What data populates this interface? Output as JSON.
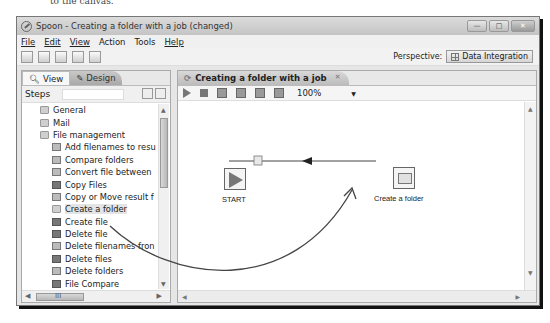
{
  "caption_fragment": "to the canvas.",
  "window": {
    "title": "Spoon - Creating a folder with a job (changed)",
    "controls": [
      "minimize",
      "maximize",
      "close"
    ]
  },
  "menu": [
    {
      "label": "File",
      "mnemonic": "F"
    },
    {
      "label": "Edit",
      "mnemonic": "E"
    },
    {
      "label": "View",
      "mnemonic": "V"
    },
    {
      "label": "Action",
      "mnemonic": ""
    },
    {
      "label": "Tools",
      "mnemonic": ""
    },
    {
      "label": "Help",
      "mnemonic": "H"
    }
  ],
  "toolbar": {
    "icons": [
      "new-file-icon",
      "open-icon",
      "explore-repository-icon",
      "save-icon",
      "save-as-icon"
    ],
    "perspective_label": "Perspective:",
    "perspective_value": "Data Integration"
  },
  "left_panel": {
    "tabs": [
      {
        "label": "View",
        "icon": "magnifier-icon"
      },
      {
        "label": "Design",
        "icon": "pencil-icon",
        "active": true
      }
    ],
    "steps_label": "Steps",
    "steps_search_value": "",
    "tree": [
      {
        "label": "General",
        "type": "category",
        "icon": "folder-icon"
      },
      {
        "label": "Mail",
        "type": "category",
        "icon": "folder-icon"
      },
      {
        "label": "File management",
        "type": "category",
        "icon": "folder-icon",
        "expanded": true
      },
      {
        "label": "Add filenames to resu",
        "type": "leaf",
        "icon": "add-filenames-icon"
      },
      {
        "label": "Compare folders",
        "type": "leaf",
        "icon": "compare-folders-icon"
      },
      {
        "label": "Convert file between",
        "type": "leaf",
        "icon": "convert-file-icon"
      },
      {
        "label": "Copy Files",
        "type": "leaf",
        "icon": "copy-files-icon"
      },
      {
        "label": "Copy or Move result f",
        "type": "leaf",
        "icon": "copy-move-icon"
      },
      {
        "label": "Create a folder",
        "type": "leaf",
        "icon": "create-folder-icon",
        "selected": true
      },
      {
        "label": "Create file",
        "type": "leaf",
        "icon": "create-file-icon"
      },
      {
        "label": "Delete file",
        "type": "leaf",
        "icon": "delete-file-icon"
      },
      {
        "label": "Delete filenames fron",
        "type": "leaf",
        "icon": "delete-filenames-icon"
      },
      {
        "label": "Delete files",
        "type": "leaf",
        "icon": "delete-files-icon"
      },
      {
        "label": "Delete folders",
        "type": "leaf",
        "icon": "delete-folders-icon"
      },
      {
        "label": "File Compare",
        "type": "leaf",
        "icon": "file-compare-icon"
      }
    ],
    "hscroll_grip": "III"
  },
  "job_tab": {
    "title": "Creating a folder with a job",
    "close_glyph": "✕",
    "zoom_value": "100%"
  },
  "canvas": {
    "nodes": [
      {
        "id": "start",
        "label": "START"
      },
      {
        "id": "create-folder",
        "label": "Create a folder"
      }
    ],
    "hops": [
      {
        "from": "start",
        "to": "create-folder"
      }
    ],
    "annotation": "drag arrow from Create a folder step to canvas"
  }
}
